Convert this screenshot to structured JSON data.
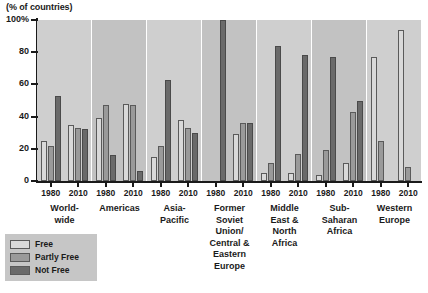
{
  "chart_data": {
    "type": "bar",
    "title": "(% of countries)",
    "xlabel": "",
    "ylabel": "(% of countries)",
    "ylim": [
      0,
      100
    ],
    "yticks": [
      "0",
      "20",
      "40",
      "60",
      "80",
      "100%"
    ],
    "grid": false,
    "legend_position": "bottom-left",
    "categories": [
      "World-wide 1980",
      "World-wide 2010",
      "Americas 1980",
      "Americas 2010",
      "Asia-Pacific 1980",
      "Asia-Pacific 2010",
      "Former Soviet Union/Central & Eastern Europe 1980",
      "Former Soviet Union/Central & Eastern Europe 2010",
      "Middle East & North Africa 1980",
      "Middle East & North Africa 2010",
      "Sub-Saharan Africa 1980",
      "Sub-Saharan Africa 2010",
      "Western Europe 1980",
      "Western Europe 2010"
    ],
    "series": [
      {
        "name": "Free",
        "color": "#d9d9d9",
        "values": [
          25,
          35,
          39,
          48,
          15,
          38,
          0,
          29,
          5,
          5,
          4,
          11,
          77,
          94
        ]
      },
      {
        "name": "Partly Free",
        "color": "#9a9a9a",
        "values": [
          22,
          33,
          47,
          47,
          22,
          33,
          0,
          36,
          11,
          17,
          19,
          43,
          25,
          9
        ]
      },
      {
        "name": "Not Free",
        "color": "#6a6a6a",
        "values": [
          53,
          32,
          16,
          6,
          63,
          30,
          100,
          36,
          84,
          78,
          77,
          50,
          0,
          0
        ]
      }
    ],
    "groups": [
      {
        "label": "World-\nwide",
        "years": [
          "1980",
          "2010"
        ]
      },
      {
        "label": "Americas",
        "years": [
          "1980",
          "2010"
        ]
      },
      {
        "label": "Asia-\nPacific",
        "years": [
          "1980",
          "2010"
        ]
      },
      {
        "label": "Former\nSoviet\nUnion/\nCentral &\nEastern\nEurope",
        "years": [
          "1980",
          "2010"
        ]
      },
      {
        "label": "Middle\nEast &\nNorth\nAfrica",
        "years": [
          "1980",
          "2010"
        ]
      },
      {
        "label": "Sub-\nSaharan\nAfrica",
        "years": [
          "1980",
          "2010"
        ]
      },
      {
        "label": "Western\nEurope",
        "years": [
          "1980",
          "2010"
        ]
      }
    ],
    "legend": [
      {
        "label": "Free",
        "key": "free"
      },
      {
        "label": "Partly Free",
        "key": "partly"
      },
      {
        "label": "Not Free",
        "key": "notfree"
      }
    ]
  }
}
